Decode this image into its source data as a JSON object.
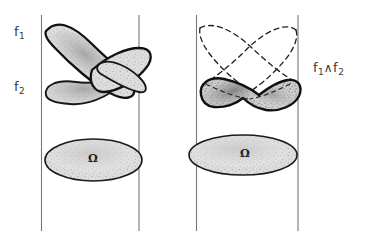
{
  "figure": {
    "background_color": "#ffffff",
    "ink_color": "#1a1a1a",
    "line_color": "#6f6f6f",
    "fill_color": "#d8d8d8",
    "width": 380,
    "height": 251
  },
  "labels": {
    "f1": "f",
    "f1_sub": "1",
    "f2": "f",
    "f2_sub": "2",
    "meet_first": "f",
    "meet_first_sub": "1",
    "meet_operator": "∧",
    "meet_second": "f",
    "meet_second_sub": "2"
  },
  "omega": {
    "left_symbol": "Ω",
    "right_symbol": "Ω"
  },
  "panels": {
    "left": {
      "name": "left-panel",
      "line_left_x": 41,
      "line_right_x": 139,
      "line_top_y": 15,
      "line_bottom_y": 231,
      "shapes": [
        "lens-f1",
        "lens-f2",
        "omega-ellipse-left"
      ]
    },
    "right": {
      "name": "right-panel",
      "line_left_x": 196,
      "line_right_x": 298,
      "line_top_y": 15,
      "line_bottom_y": 231,
      "shapes": [
        "dashed-lens-upper-a",
        "dashed-lens-upper-b",
        "solid-meet-shape",
        "omega-ellipse-right"
      ]
    }
  }
}
